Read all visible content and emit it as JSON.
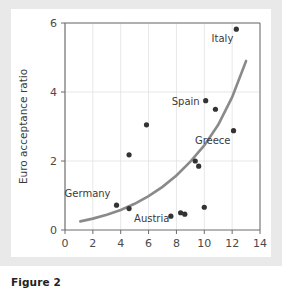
{
  "figure": {
    "caption": "Figure 2"
  },
  "chart_data": {
    "type": "scatter",
    "title": "",
    "xlabel": "Average inflation 1980–96",
    "ylabel": "Euro acceptance ratio",
    "xlim": [
      0,
      14
    ],
    "ylim": [
      0,
      6
    ],
    "xticks": [
      0,
      2,
      4,
      6,
      8,
      10,
      12,
      14
    ],
    "yticks": [
      0,
      2,
      4,
      6
    ],
    "grid": true,
    "legend": "none",
    "colors": {
      "point": "#333333",
      "curve": "#8a8a8a",
      "axis": "#6d6d6d",
      "grid": "#dcdcdc",
      "panel_background": "#ffffff",
      "page_background": "#e9e9e9"
    },
    "points": [
      {
        "x": 3.7,
        "y": 0.72,
        "label": "Germany",
        "label_pos": "above-left"
      },
      {
        "x": 4.6,
        "y": 0.62,
        "label": "Austria",
        "label_pos": "below-right"
      },
      {
        "x": 4.6,
        "y": 2.18,
        "label": "",
        "label_pos": ""
      },
      {
        "x": 5.85,
        "y": 3.05,
        "label": "",
        "label_pos": ""
      },
      {
        "x": 7.6,
        "y": 0.4,
        "label": "",
        "label_pos": ""
      },
      {
        "x": 8.3,
        "y": 0.5,
        "label": "",
        "label_pos": ""
      },
      {
        "x": 8.6,
        "y": 0.46,
        "label": "",
        "label_pos": ""
      },
      {
        "x": 9.35,
        "y": 2.0,
        "label": "",
        "label_pos": ""
      },
      {
        "x": 9.6,
        "y": 1.85,
        "label": "",
        "label_pos": ""
      },
      {
        "x": 10.0,
        "y": 0.66,
        "label": "",
        "label_pos": ""
      },
      {
        "x": 10.1,
        "y": 3.75,
        "label": "Spain",
        "label_pos": "left"
      },
      {
        "x": 10.8,
        "y": 3.5,
        "label": "",
        "label_pos": ""
      },
      {
        "x": 12.1,
        "y": 2.88,
        "label": "Greece",
        "label_pos": "below-left"
      },
      {
        "x": 12.3,
        "y": 5.82,
        "label": "Italy",
        "label_pos": "below-left"
      }
    ],
    "fit_curve": {
      "name": "exponential trend",
      "x_start": 1.1,
      "x_end": 13.0,
      "points": [
        {
          "x": 1.1,
          "y": 0.25
        },
        {
          "x": 2.0,
          "y": 0.33
        },
        {
          "x": 3.0,
          "y": 0.44
        },
        {
          "x": 4.0,
          "y": 0.58
        },
        {
          "x": 5.0,
          "y": 0.76
        },
        {
          "x": 6.0,
          "y": 0.98
        },
        {
          "x": 7.0,
          "y": 1.25
        },
        {
          "x": 8.0,
          "y": 1.58
        },
        {
          "x": 9.0,
          "y": 1.98
        },
        {
          "x": 10.0,
          "y": 2.45
        },
        {
          "x": 11.0,
          "y": 3.05
        },
        {
          "x": 12.0,
          "y": 3.85
        },
        {
          "x": 13.0,
          "y": 4.9
        }
      ]
    }
  }
}
